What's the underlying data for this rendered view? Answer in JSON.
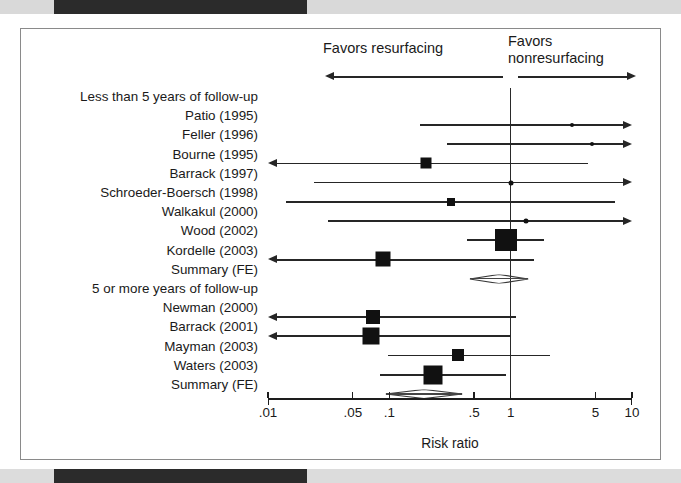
{
  "figure": {
    "frame_border_color": "#8a8a8a",
    "ink_color": "#111111",
    "scan_bar_color": "#2b2b2b"
  },
  "header": {
    "left_annotation": "Favors resurfacing",
    "right_annotation_line1": "Favors",
    "right_annotation_line2": "nonresurfacing"
  },
  "axis": {
    "title": "Risk ratio",
    "scale": "log10",
    "min": 0.01,
    "max": 10,
    "tick_labels": [
      ".01",
      ".05",
      ".1",
      ".5",
      "1",
      "5",
      "10"
    ],
    "tick_values": [
      0.01,
      0.05,
      0.1,
      0.5,
      1,
      5,
      10
    ],
    "null_value": 1
  },
  "groups": [
    {
      "label": "Less than 5 years of follow-up"
    },
    {
      "label": "5 or more years of follow-up"
    }
  ],
  "rows": [
    {
      "label": "Less than 5 years of follow-up",
      "type": "group-heading"
    },
    {
      "label": "Patio (1995)",
      "type": "study"
    },
    {
      "label": "Feller (1996)",
      "type": "study"
    },
    {
      "label": "Bourne (1995)",
      "type": "study"
    },
    {
      "label": "Barrack (1997)",
      "type": "study"
    },
    {
      "label": "Schroeder-Boersch (1998)",
      "type": "study"
    },
    {
      "label": "Walkakul (2000)",
      "type": "study"
    },
    {
      "label": "Wood (2002)",
      "type": "study"
    },
    {
      "label": "Kordelle (2003)",
      "type": "study"
    },
    {
      "label": "Summary (FE)",
      "type": "summary"
    },
    {
      "label": "5 or more years of follow-up",
      "type": "group-heading"
    },
    {
      "label": "Newman (2000)",
      "type": "study"
    },
    {
      "label": "Barrack (2001)",
      "type": "study"
    },
    {
      "label": "Mayman (2003)",
      "type": "study"
    },
    {
      "label": "Waters (2003)",
      "type": "study"
    },
    {
      "label": "Summary (FE)",
      "type": "summary"
    }
  ],
  "chart_data": {
    "type": "forest",
    "title": "",
    "xlabel": "Risk ratio",
    "ylabel": "",
    "xscale": "log",
    "xlim": [
      0.01,
      10
    ],
    "xticks": [
      0.01,
      0.05,
      0.1,
      0.5,
      1,
      5,
      10
    ],
    "xticklabels": [
      ".01",
      ".05",
      ".1",
      ".5",
      "1",
      "5",
      "10"
    ],
    "null_line": 1,
    "grid": false,
    "legend": "none",
    "annotations": [
      "Favors resurfacing",
      "Favors nonresurfacing"
    ],
    "entries": [
      {
        "study": "Patio (1995)",
        "group": "Less than 5 years of follow-up",
        "estimate": 3.2,
        "ci_low": 0.18,
        "ci_high": 10,
        "marker": "dot",
        "marker_size": 4,
        "arrow_left": false,
        "arrow_right": true
      },
      {
        "study": "Feller (1996)",
        "group": "Less than 5 years of follow-up",
        "estimate": 4.7,
        "ci_low": 0.3,
        "ci_high": 10,
        "marker": "dot",
        "marker_size": 4,
        "arrow_left": false,
        "arrow_right": true
      },
      {
        "study": "Bourne (1995)",
        "group": "Less than 5 years of follow-up",
        "estimate": 0.2,
        "ci_low": 0.01,
        "ci_high": 4.3,
        "marker": "square",
        "marker_size": 11,
        "arrow_left": true,
        "arrow_right": false
      },
      {
        "study": "Barrack (1997)",
        "group": "Less than 5 years of follow-up",
        "estimate": 1.0,
        "ci_low": 0.024,
        "ci_high": 10,
        "marker": "dot",
        "marker_size": 5,
        "arrow_left": false,
        "arrow_right": true
      },
      {
        "study": "Schroeder-Boersch (1998)",
        "group": "Less than 5 years of follow-up",
        "estimate": 0.32,
        "ci_low": 0.014,
        "ci_high": 7.3,
        "marker": "square",
        "marker_size": 8,
        "arrow_left": false,
        "arrow_right": false
      },
      {
        "study": "Walkakul (2000)",
        "group": "Less than 5 years of follow-up",
        "estimate": 1.35,
        "ci_low": 0.031,
        "ci_high": 10,
        "marker": "dot",
        "marker_size": 5,
        "arrow_left": false,
        "arrow_right": true
      },
      {
        "study": "Wood (2002)",
        "group": "Less than 5 years of follow-up",
        "estimate": 0.92,
        "ci_low": 0.44,
        "ci_high": 1.9,
        "marker": "square",
        "marker_size": 22,
        "arrow_left": false,
        "arrow_right": false
      },
      {
        "study": "Kordelle (2003)",
        "group": "Less than 5 years of follow-up",
        "estimate": 0.088,
        "ci_low": 0.01,
        "ci_high": 1.55,
        "marker": "square",
        "marker_size": 15,
        "arrow_left": true,
        "arrow_right": false
      },
      {
        "study": "Summary (FE)",
        "group": "Less than 5 years of follow-up",
        "estimate": 0.82,
        "ci_low": 0.46,
        "ci_high": 1.4,
        "marker": "diamond",
        "marker_size": 0,
        "arrow_left": false,
        "arrow_right": false
      },
      {
        "study": "Newman (2000)",
        "group": "5 or more years of follow-up",
        "estimate": 0.073,
        "ci_low": 0.01,
        "ci_high": 1.1,
        "marker": "square",
        "marker_size": 14,
        "arrow_left": true,
        "arrow_right": false
      },
      {
        "study": "Barrack (2001)",
        "group": "5 or more years of follow-up",
        "estimate": 0.07,
        "ci_low": 0.01,
        "ci_high": 1.0,
        "marker": "square",
        "marker_size": 17,
        "arrow_left": true,
        "arrow_right": false
      },
      {
        "study": "Mayman (2003)",
        "group": "5 or more years of follow-up",
        "estimate": 0.37,
        "ci_low": 0.097,
        "ci_high": 2.1,
        "marker": "square",
        "marker_size": 12,
        "arrow_left": false,
        "arrow_right": false
      },
      {
        "study": "Waters (2003)",
        "group": "5 or more years of follow-up",
        "estimate": 0.23,
        "ci_low": 0.084,
        "ci_high": 0.92,
        "marker": "square",
        "marker_size": 19,
        "arrow_left": false,
        "arrow_right": false
      },
      {
        "study": "Summary (FE)",
        "group": "5 or more years of follow-up",
        "estimate": 0.175,
        "ci_low": 0.093,
        "ci_high": 0.4,
        "marker": "diamond",
        "marker_size": 0,
        "arrow_left": false,
        "arrow_right": false
      }
    ]
  }
}
